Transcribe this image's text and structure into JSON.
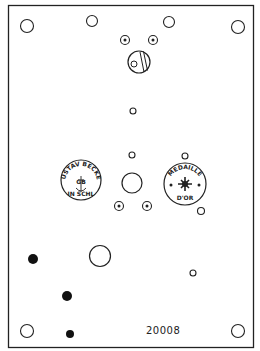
{
  "diagram": {
    "serial_number": "20008",
    "stamp_left": {
      "top_text": "GUSTAV BECKER",
      "monogram": "GB",
      "bottom_text": "IN SCHL"
    },
    "stamp_right": {
      "top_text": "MEDAILLE",
      "bottom_text": "D'OR"
    },
    "colors": {
      "line": "#222222",
      "background": "#ffffff"
    }
  }
}
